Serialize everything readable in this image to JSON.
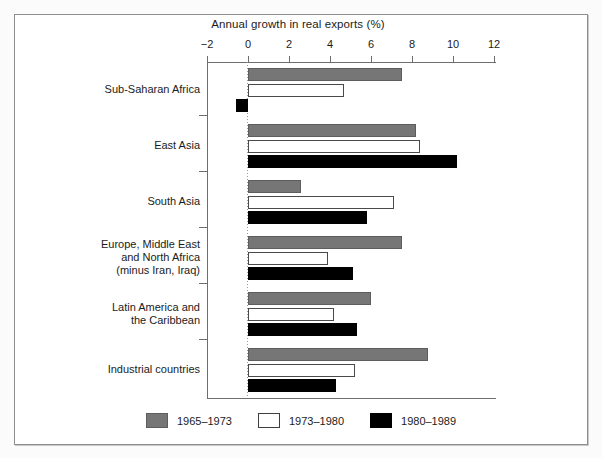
{
  "chart_data": {
    "type": "bar",
    "orientation": "horizontal",
    "title": "Annual growth in real exports (%)",
    "xlabel": "",
    "ylabel": "",
    "xlim": [
      -2,
      12
    ],
    "xticks": [
      -2,
      0,
      2,
      4,
      6,
      8,
      10,
      12
    ],
    "xticklabels": [
      "−2",
      "0",
      "2",
      "4",
      "6",
      "8",
      "10",
      "12"
    ],
    "grid": false,
    "legend_position": "bottom",
    "categories": [
      "Sub-Saharan Africa",
      "East Asia",
      "South Asia",
      "Europe, Middle East\nand North Africa\n(minus Iran, Iraq)",
      "Latin America and\nthe Caribbean",
      "Industrial countries"
    ],
    "series": [
      {
        "name": "1965–1973",
        "color": "#767676",
        "values": [
          7.5,
          8.2,
          2.6,
          7.5,
          6.0,
          8.8
        ]
      },
      {
        "name": "1973–1980",
        "color": "#ffffff",
        "values": [
          4.7,
          8.4,
          7.1,
          3.9,
          4.2,
          5.2
        ]
      },
      {
        "name": "1980–1989",
        "color": "#000000",
        "values": [
          -0.6,
          10.2,
          5.8,
          5.1,
          5.3,
          4.3
        ]
      }
    ]
  },
  "legend": {
    "items": [
      {
        "label": "1965–1973",
        "swatch": "s0"
      },
      {
        "label": "1973–1980",
        "swatch": "s1"
      },
      {
        "label": "1980–1989",
        "swatch": "s2"
      }
    ]
  }
}
